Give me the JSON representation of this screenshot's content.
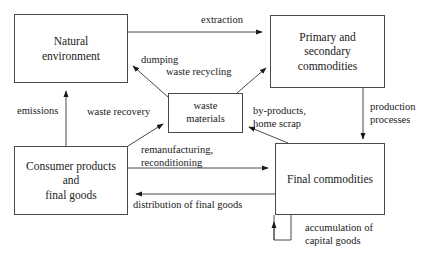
{
  "diagram": {
    "colors": {
      "stroke": "#4a4a4a",
      "arrow": "#1a1a1a",
      "text": "#1a1a1a",
      "background": "#ffffff"
    },
    "nodes": [
      {
        "id": "natural-environment",
        "label": "Natural\nenvironment"
      },
      {
        "id": "primary-commodities",
        "label": "Primary and secondary\ncommodities"
      },
      {
        "id": "waste-materials",
        "label": "waste\nmaterials"
      },
      {
        "id": "consumer-products",
        "label": "Consumer products and\nfinal goods"
      },
      {
        "id": "final-commodities",
        "label": "Final commodities"
      }
    ],
    "edges": [
      {
        "id": "extraction",
        "label": "extraction",
        "from": "natural-environment",
        "to": "primary-commodities"
      },
      {
        "id": "dumping",
        "label": "dumping",
        "from": "waste-materials",
        "to": "natural-environment"
      },
      {
        "id": "waste-recycling",
        "label": "waste recycling",
        "from": "waste-materials",
        "to": "primary-commodities"
      },
      {
        "id": "emissions",
        "label": "emissions",
        "from": "consumer-products",
        "to": "natural-environment"
      },
      {
        "id": "waste-recovery",
        "label": "waste recovery",
        "from": "consumer-products",
        "to": "waste-materials"
      },
      {
        "id": "by-products",
        "label": "by-products,\nhome scrap",
        "from": "final-commodities",
        "to": "waste-materials"
      },
      {
        "id": "production-processes",
        "label": "production\nprocesses",
        "from": "primary-commodities",
        "to": "final-commodities"
      },
      {
        "id": "remanufacturing",
        "label": "remanufacturing,\nreconditioning",
        "from": "consumer-products",
        "to": "final-commodities"
      },
      {
        "id": "distribution",
        "label": "distribution of final goods",
        "from": "final-commodities",
        "to": "consumer-products"
      },
      {
        "id": "accumulation",
        "label": "accumulation of\ncapital goods",
        "from": "distribution",
        "to": "final-commodities"
      }
    ]
  }
}
